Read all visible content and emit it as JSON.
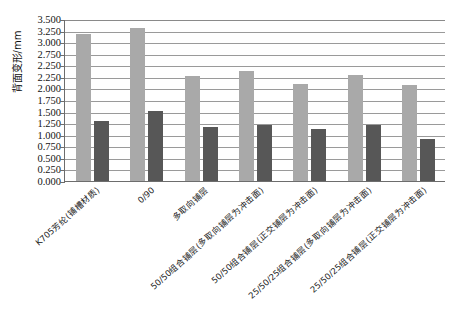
{
  "chart_data": {
    "type": "bar",
    "title": "",
    "subtitle": "",
    "xlabel": "",
    "ylabel": "背面变形/mm",
    "ylim": [
      0.0,
      3.5
    ],
    "ytick_step": 0.25,
    "ytick_labels": [
      "3.500",
      "3.250",
      "3.000",
      "2.750",
      "2.250",
      "2.250",
      "2.000",
      "1.750",
      "1.500",
      "1.250",
      "1.000",
      "0.750",
      "0.500",
      "0.250",
      "0.000"
    ],
    "ytick_values": [
      3.5,
      3.25,
      3.0,
      2.75,
      2.5,
      2.25,
      2.0,
      1.75,
      1.5,
      1.25,
      1.0,
      0.75,
      0.5,
      0.25,
      0.0
    ],
    "grid": true,
    "grid_axis": "y",
    "legend": false,
    "legend_position": "none",
    "categories": [
      "K705芳纶(铺槽材质)",
      "0/90",
      "多取向铺层",
      "50/50组合铺层(多取向铺层为冲击面)",
      "50/50组合铺层(正交铺层为冲击面)",
      "25/50/25组合铺层(多取向铺层为冲击面)",
      "25/50/25组合铺层(正交铺层为冲击面)"
    ],
    "series": [
      {
        "name": "series-a",
        "color": "#a9a9a9",
        "values": [
          3.17,
          3.3,
          2.26,
          2.38,
          2.1,
          2.3,
          2.08
        ]
      },
      {
        "name": "series-b",
        "color": "#575757",
        "values": [
          1.29,
          1.52,
          1.16,
          1.21,
          1.12,
          1.22,
          0.91
        ]
      }
    ]
  },
  "colors": {
    "series_a": "#a9a9a9",
    "series_b": "#575757",
    "gridline": "#9a9a9a",
    "axis": "#6d6d6d",
    "text": "#1a1a1a",
    "background": "#ffffff"
  }
}
